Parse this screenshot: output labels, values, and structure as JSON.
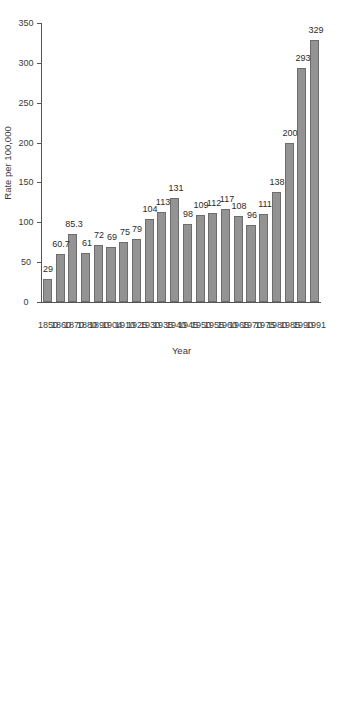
{
  "chart_data": {
    "type": "bar",
    "orientation": "vertical-rotated",
    "title": "",
    "xlabel": "Year",
    "ylabel": "Rate per 100,000",
    "ylim": [
      0,
      350
    ],
    "yticks": [
      0,
      50,
      100,
      150,
      200,
      250,
      300,
      350
    ],
    "ytick_labels": [
      "0",
      "50",
      "100",
      "150",
      "200",
      "250",
      "300",
      "350"
    ],
    "grid": false,
    "legend": null,
    "bar_color": "#939393",
    "bar_edge_color": "#6d6d6d",
    "axis_color": "#555555",
    "categories": [
      "1850",
      "1860",
      "1870",
      "1880",
      "1890",
      "1904",
      "1910",
      "1925",
      "1930",
      "1935",
      "1940",
      "1945",
      "1950",
      "1955",
      "1960",
      "1965",
      "1970",
      "1975",
      "1980",
      "1985",
      "1990",
      "1991"
    ],
    "values": [
      29,
      60.7,
      85.3,
      61,
      72,
      69,
      75,
      79,
      104,
      113,
      131,
      98,
      109,
      112,
      117,
      108,
      96,
      111,
      138,
      200,
      293,
      329
    ],
    "value_labels": [
      "29",
      "60.7",
      "85.3",
      "61",
      "72",
      "69",
      "75",
      "79",
      "104",
      "113",
      "131",
      "98",
      "109",
      "112",
      "117",
      "108",
      "96",
      "111",
      "138",
      "200",
      "293",
      "329"
    ],
    "data_label_position": "outside-end"
  }
}
